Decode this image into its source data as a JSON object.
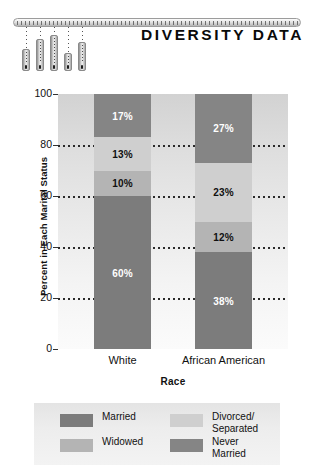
{
  "header": {
    "title": "DIVERSITY DATA",
    "decoration_icon": "hanging-bar-chart-icon",
    "hanging_bars": [
      {
        "height": 22,
        "left": 9
      },
      {
        "height": 32,
        "left": 23
      },
      {
        "height": 36,
        "left": 37
      },
      {
        "height": 18,
        "left": 51
      },
      {
        "height": 29,
        "left": 65
      }
    ]
  },
  "chart_data": {
    "type": "bar",
    "subtype": "stacked-bar",
    "title": "",
    "xlabel": "Race",
    "ylabel": "Percent in Each Marital Status",
    "categories": [
      "White",
      "African American"
    ],
    "ylim": [
      0,
      100
    ],
    "yticks": [
      0,
      20,
      40,
      60,
      80,
      100
    ],
    "gridlines": [
      20,
      40,
      60,
      80
    ],
    "grid": true,
    "grid_style": "dotted",
    "legend_position": "bottom",
    "stack_order_bottom_to_top": [
      "Married",
      "Widowed",
      "Divorced/Separated",
      "Never Married"
    ],
    "series": [
      {
        "name": "Married",
        "values": [
          60,
          38
        ],
        "color": "#7c7c7c",
        "label_color": "light"
      },
      {
        "name": "Widowed",
        "values": [
          10,
          12
        ],
        "color": "#b4b4b4",
        "label_color": "dark"
      },
      {
        "name": "Divorced/Separated",
        "values": [
          13,
          23
        ],
        "color": "#cfcfcf",
        "label_color": "dark"
      },
      {
        "name": "Never Married",
        "values": [
          17,
          27
        ],
        "color": "#858585",
        "label_color": "light"
      }
    ],
    "data_labels": {
      "White": [
        "60%",
        "10%",
        "13%",
        "17%"
      ],
      "African American": [
        "38%",
        "12%",
        "23%",
        "27%"
      ]
    }
  },
  "ytick_labels": [
    "100",
    "80",
    "60",
    "40",
    "20",
    "0"
  ],
  "legend": {
    "entries": [
      {
        "label": "Married",
        "color": "#7c7c7c"
      },
      {
        "label": "Divorced/\nSeparated",
        "color": "#cfcfcf"
      },
      {
        "label": "Widowed",
        "color": "#b4b4b4"
      },
      {
        "label": "Never Married",
        "color": "#858585"
      }
    ]
  }
}
